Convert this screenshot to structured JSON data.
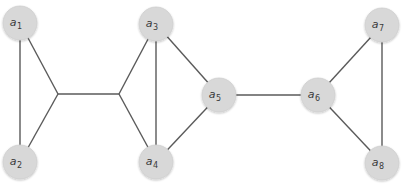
{
  "diagram": {
    "type": "graph",
    "node_radius": 17,
    "colors": {
      "node_fill": "#d8d8d8",
      "edge": "#5a5a5a",
      "label": "#3a3a3a"
    },
    "nodes": [
      {
        "id": "a1",
        "base": "a",
        "sub": "1",
        "x": 20,
        "y": 23
      },
      {
        "id": "a2",
        "base": "a",
        "sub": "2",
        "x": 20,
        "y": 162
      },
      {
        "id": "a3",
        "base": "a",
        "sub": "3",
        "x": 156,
        "y": 24
      },
      {
        "id": "a4",
        "base": "a",
        "sub": "4",
        "x": 156,
        "y": 162
      },
      {
        "id": "a5",
        "base": "a",
        "sub": "5",
        "x": 219,
        "y": 95
      },
      {
        "id": "a6",
        "base": "a",
        "sub": "6",
        "x": 318,
        "y": 95
      },
      {
        "id": "a7",
        "base": "a",
        "sub": "7",
        "x": 382,
        "y": 25
      },
      {
        "id": "a8",
        "base": "a",
        "sub": "8",
        "x": 382,
        "y": 163
      }
    ],
    "junctions": [
      {
        "id": "j1",
        "x": 58,
        "y": 94
      },
      {
        "id": "j2",
        "x": 119,
        "y": 94
      }
    ],
    "edges": [
      {
        "from": "a1",
        "to": "a2"
      },
      {
        "from": "a1",
        "to": "j1"
      },
      {
        "from": "a2",
        "to": "j1"
      },
      {
        "from": "j1",
        "to": "j2"
      },
      {
        "from": "j2",
        "to": "a3"
      },
      {
        "from": "j2",
        "to": "a4"
      },
      {
        "from": "a3",
        "to": "a4"
      },
      {
        "from": "a3",
        "to": "a5"
      },
      {
        "from": "a4",
        "to": "a5"
      },
      {
        "from": "a5",
        "to": "a6"
      },
      {
        "from": "a6",
        "to": "a7"
      },
      {
        "from": "a6",
        "to": "a8"
      },
      {
        "from": "a7",
        "to": "a8"
      }
    ]
  }
}
